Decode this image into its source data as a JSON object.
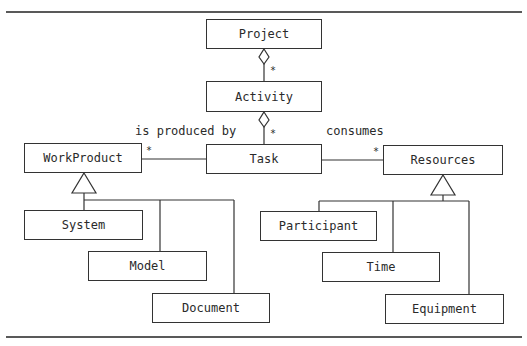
{
  "diagram": {
    "type": "UML class diagram",
    "classes": {
      "project": "Project",
      "activity": "Activity",
      "task": "Task",
      "workproduct": "WorkProduct",
      "resources": "Resources",
      "system": "System",
      "model": "Model",
      "document": "Document",
      "participant": "Participant",
      "time": "Time",
      "equipment": "Equipment"
    },
    "associations": {
      "produced_by": "is produced by",
      "consumes": "consumes"
    },
    "multiplicities": {
      "project_activity": "*",
      "activity_task": "*",
      "task_workproduct": "*",
      "task_resources": "*"
    },
    "colors": {
      "line": "#333333",
      "background": "#ffffff"
    }
  }
}
